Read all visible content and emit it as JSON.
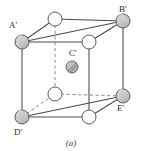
{
  "figure": {
    "caption": "(a)",
    "type": "crystal-unit-cell-diagram",
    "projection": "oblique",
    "colors": {
      "line": "#4a4a4a",
      "hidden_line": "#8c8c8c",
      "corner_atom_fill": "#c9c9c9",
      "face_atom_fill": "#ffffff",
      "center_atom_fill": "#b4b4b4",
      "atom_stroke": "#5a5a5a",
      "label_text": "#2a2a2a",
      "background": "#ffffff"
    },
    "labels": {
      "a_prime": "A'",
      "b_prime": "B'",
      "c_prime": "C'",
      "d_prime": "D'",
      "e_prime": "E'"
    },
    "atoms": [
      {
        "id": "A'",
        "name": "corner-atom-a-prime",
        "cx": 22,
        "cy": 42,
        "r": 7.0,
        "style": "shaded",
        "labeled": true
      },
      {
        "id": "B'",
        "name": "corner-atom-b-prime",
        "cx": 123,
        "cy": 21,
        "r": 7.0,
        "style": "shaded",
        "labeled": true
      },
      {
        "id": "D'",
        "name": "corner-atom-d-prime",
        "cx": 22,
        "cy": 117,
        "r": 7.0,
        "style": "shaded",
        "labeled": true
      },
      {
        "id": "E'",
        "name": "corner-atom-e-prime",
        "cx": 123,
        "cy": 96,
        "r": 7.0,
        "style": "shaded",
        "labeled": true
      },
      {
        "id": "top-back",
        "name": "face-atom-top-back",
        "cx": 55,
        "cy": 19,
        "r": 7.0,
        "style": "open",
        "labeled": false
      },
      {
        "id": "top-front",
        "name": "face-atom-top-front",
        "cx": 89,
        "cy": 42,
        "r": 7.0,
        "style": "open",
        "labeled": false
      },
      {
        "id": "bot-back",
        "name": "face-atom-bottom-back",
        "cx": 55,
        "cy": 94,
        "r": 7.0,
        "style": "open",
        "labeled": false
      },
      {
        "id": "bot-front",
        "name": "face-atom-bottom-front",
        "cx": 89,
        "cy": 117,
        "r": 7.0,
        "style": "open",
        "labeled": false
      },
      {
        "id": "C'",
        "name": "body-center-atom-c-prime",
        "cx": 72,
        "cy": 67,
        "r": 6.0,
        "style": "hatched",
        "labeled": true
      }
    ],
    "edges": {
      "solid": [
        {
          "name": "edge-a-to-b",
          "x1": 22,
          "y1": 42,
          "x2": 123,
          "y2": 21
        },
        {
          "name": "edge-a-to-top-back",
          "x1": 22,
          "y1": 42,
          "x2": 55,
          "y2": 19
        },
        {
          "name": "edge-top-back-to-b",
          "x1": 55,
          "y1": 19,
          "x2": 123,
          "y2": 21
        },
        {
          "name": "edge-a-to-top-front",
          "x1": 22,
          "y1": 42,
          "x2": 89,
          "y2": 42
        },
        {
          "name": "edge-top-front-to-b",
          "x1": 89,
          "y1": 42,
          "x2": 123,
          "y2": 21
        },
        {
          "name": "edge-a-to-d-vertical",
          "x1": 22,
          "y1": 42,
          "x2": 22,
          "y2": 117
        },
        {
          "name": "edge-b-to-e-vertical",
          "x1": 123,
          "y1": 21,
          "x2": 123,
          "y2": 96
        },
        {
          "name": "edge-top-front-vertical",
          "x1": 89,
          "y1": 42,
          "x2": 89,
          "y2": 117
        },
        {
          "name": "edge-d-to-e",
          "x1": 22,
          "y1": 117,
          "x2": 123,
          "y2": 96
        },
        {
          "name": "edge-d-to-bot-front",
          "x1": 22,
          "y1": 117,
          "x2": 89,
          "y2": 117
        },
        {
          "name": "edge-bot-front-to-e",
          "x1": 89,
          "y1": 117,
          "x2": 123,
          "y2": 96
        }
      ],
      "dashed": [
        {
          "name": "hidden-edge-top-back-vertical",
          "x1": 55,
          "y1": 19,
          "x2": 55,
          "y2": 94
        },
        {
          "name": "hidden-edge-d-to-bot-back",
          "x1": 22,
          "y1": 117,
          "x2": 55,
          "y2": 94
        },
        {
          "name": "hidden-edge-bot-back-to-e",
          "x1": 55,
          "y1": 94,
          "x2": 123,
          "y2": 96
        }
      ]
    }
  }
}
